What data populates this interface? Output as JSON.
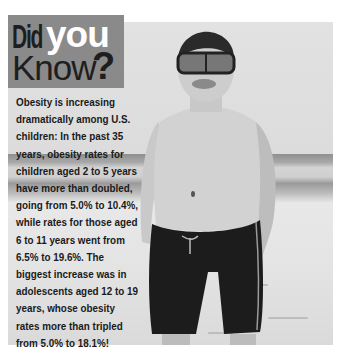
{
  "title": {
    "word1": "Did",
    "word2": "you",
    "word3": "Know",
    "mark": "?"
  },
  "body": {
    "lines": [
      "Obesity is increasing",
      "dramatically among U.S.",
      "children: In the past 35",
      "years, obesity rates for",
      "children aged 2 to 5 years",
      "have more than doubled,",
      "going from 5.0% to 10.4%,",
      "while rates for those aged",
      "6 to 11 years went from",
      "6.5% to 19.6%.  The",
      "biggest increase was in",
      "adolescents aged 12 to 19",
      "years, whose obesity",
      "rates more than tripled",
      "from 5.0% to 18.1%!"
    ]
  },
  "photo": {
    "subject": "boy-in-snorkel-mask-on-beach"
  },
  "colors": {
    "title_box": "#8a8a8a",
    "title_dark": "#1e1e1e",
    "title_light": "#ffffff",
    "text": "#1a1a1a"
  }
}
